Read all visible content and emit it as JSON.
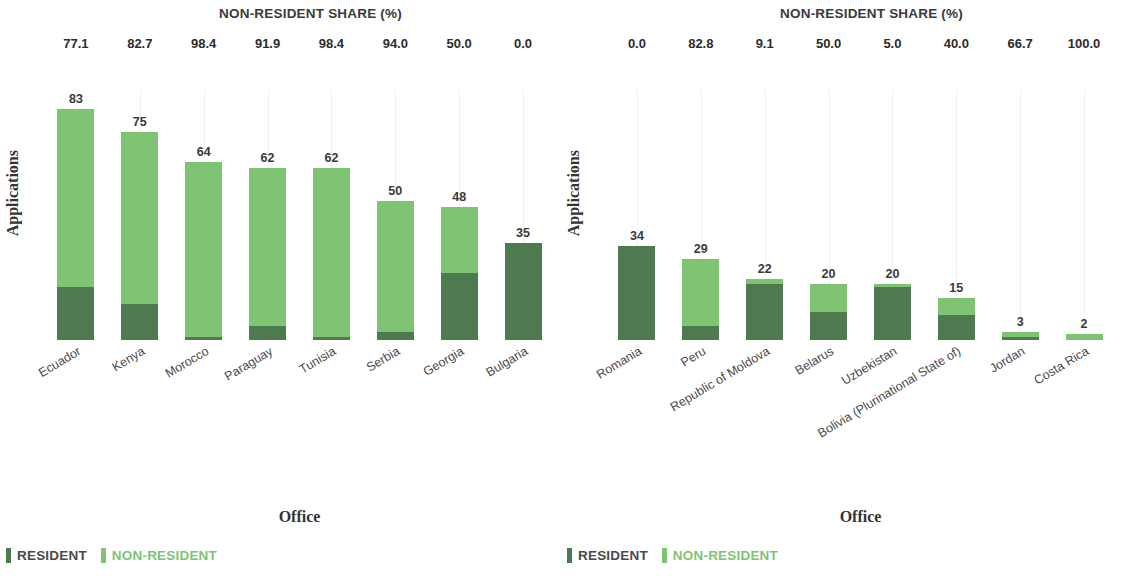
{
  "colors": {
    "resident": "#4e7a4f",
    "non_resident": "#7ec472",
    "text": "#3a3a3a"
  },
  "legend": {
    "resident_label": "RESIDENT",
    "non_resident_label": "NON-RESIDENT"
  },
  "axis": {
    "y_title": "Applications",
    "x_title": "Office",
    "share_header": "NON-RESIDENT SHARE (%)"
  },
  "chart_data": [
    {
      "type": "bar",
      "panel": "left",
      "stacked": true,
      "title": "NON-RESIDENT SHARE (%)",
      "xlabel": "Office",
      "ylabel": "Applications",
      "ylim": [
        0,
        90
      ],
      "grid": true,
      "legend_position": "bottom-left",
      "categories": [
        "Ecuador",
        "Kenya",
        "Morocco",
        "Paraguay",
        "Tunisia",
        "Serbia",
        "Georgia",
        "Bulgaria"
      ],
      "totals": [
        83,
        75,
        64,
        62,
        62,
        50,
        48,
        35
      ],
      "non_resident_share_pct": [
        77.1,
        82.7,
        98.4,
        91.9,
        98.4,
        94.0,
        50.0,
        0.0
      ],
      "series": [
        {
          "name": "NON-RESIDENT",
          "values": [
            64,
            62,
            63,
            57,
            61,
            47,
            24,
            0
          ]
        },
        {
          "name": "RESIDENT",
          "values": [
            19,
            13,
            1,
            5,
            1,
            3,
            24,
            35
          ]
        }
      ]
    },
    {
      "type": "bar",
      "panel": "right",
      "stacked": true,
      "title": "NON-RESIDENT SHARE (%)",
      "xlabel": "Office",
      "ylabel": "Applications",
      "ylim": [
        0,
        90
      ],
      "grid": true,
      "legend_position": "bottom-left",
      "categories": [
        "Romania",
        "Peru",
        "Republic of Moldova",
        "Belarus",
        "Uzbekistan",
        "Bolivia (Plurinational State of)",
        "Jordan",
        "Costa Rica"
      ],
      "totals": [
        34,
        29,
        22,
        20,
        20,
        15,
        3,
        2
      ],
      "non_resident_share_pct": [
        0.0,
        82.8,
        9.1,
        50.0,
        5.0,
        40.0,
        66.7,
        100.0
      ],
      "series": [
        {
          "name": "NON-RESIDENT",
          "values": [
            0,
            24,
            2,
            10,
            1,
            6,
            2,
            2
          ]
        },
        {
          "name": "RESIDENT",
          "values": [
            34,
            5,
            20,
            10,
            19,
            9,
            1,
            0
          ]
        }
      ]
    }
  ]
}
